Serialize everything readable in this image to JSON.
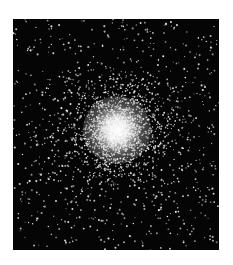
{
  "image": {
    "subject": "globular star cluster",
    "background_color": "#050505",
    "frame": {
      "x": 13,
      "y": 19,
      "width": 206,
      "height": 231
    },
    "core_center": {
      "x": 104,
      "y": 111
    },
    "core_color": "#ffffff",
    "star_color": "#c8c8c8"
  }
}
